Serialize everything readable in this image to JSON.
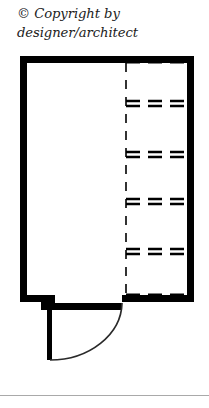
{
  "document": {
    "title": "Floor Plan Drawing",
    "caption_line_1": "© Copyright by",
    "caption_line_2": "designer/architect",
    "caption_text": "© Copyright by\ndesigner/architect"
  },
  "colors": {
    "wall": "#000000",
    "background": "#ffffff",
    "dashed_line": "#000000",
    "caption_text": "#1b1b1b",
    "separator_rule": "#a9a9a9"
  },
  "plan": {
    "name": "room-floor-plan",
    "description": "Rectangular room with thick perimeter walls, a built-in closet with shelves along the right side, and a swing door at the bottom left",
    "wall_thickness_px": 7,
    "outline": {
      "name": "perimeter-wall",
      "left_x": 20,
      "top_y": 56,
      "right_x": 194,
      "bottom_y": 302,
      "step_x": 48,
      "step_y": 310
    },
    "closet": {
      "name": "closet-shelving",
      "divider_x": 126,
      "divider_top_y": 62,
      "divider_bottom_y": 300,
      "shelf_count": 6,
      "shelf_y_positions": [
        63,
        103,
        155,
        201,
        251,
        296
      ],
      "shelf_left_x": 126,
      "shelf_right_x": 190,
      "dash_pattern": "9 7"
    },
    "door": {
      "name": "swing-door",
      "hinge_x": 122,
      "hinge_y": 303,
      "leaf_x": 48,
      "leaf_top_y": 302,
      "leaf_bottom_y": 360,
      "opening_width_px": 74,
      "swing_direction": "counter-clockwise-inward",
      "arc_radius_px": 74
    }
  }
}
